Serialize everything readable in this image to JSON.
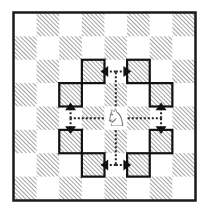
{
  "diagram": {
    "board": {
      "files": 8,
      "ranks": 8,
      "top_left_square_color": "light",
      "light_color": "#ffffff",
      "dark_hatch_color": "#8a8a8a",
      "border_color": "#1a1a1a"
    },
    "piece": {
      "name": "knight",
      "color": "white",
      "glyph": "♘",
      "square": {
        "col": 4,
        "row": 4
      }
    },
    "highlighted_squares": [
      {
        "col": 3,
        "row": 2
      },
      {
        "col": 5,
        "row": 2
      },
      {
        "col": 2,
        "row": 3
      },
      {
        "col": 6,
        "row": 3
      },
      {
        "col": 2,
        "row": 5
      },
      {
        "col": 6,
        "row": 5
      },
      {
        "col": 3,
        "row": 6
      },
      {
        "col": 5,
        "row": 6
      }
    ],
    "move_paths": [
      {
        "via": {
          "col": 4,
          "row": 2
        },
        "targets": [
          {
            "col": 3,
            "row": 2
          },
          {
            "col": 5,
            "row": 2
          }
        ]
      },
      {
        "via": {
          "col": 4,
          "row": 6
        },
        "targets": [
          {
            "col": 3,
            "row": 6
          },
          {
            "col": 5,
            "row": 6
          }
        ]
      },
      {
        "via": {
          "col": 2,
          "row": 4
        },
        "targets": [
          {
            "col": 2,
            "row": 3
          },
          {
            "col": 2,
            "row": 5
          }
        ]
      },
      {
        "via": {
          "col": 6,
          "row": 4
        },
        "targets": [
          {
            "col": 6,
            "row": 3
          },
          {
            "col": 6,
            "row": 5
          }
        ]
      }
    ]
  }
}
